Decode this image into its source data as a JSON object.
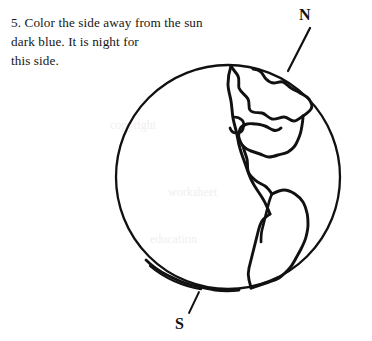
{
  "page": {
    "width": 372,
    "height": 341,
    "background_color": "#ffffff",
    "ink_color": "#111111"
  },
  "instruction": {
    "number": "5.",
    "text": "5. Color the side away from the sun\ndark blue. It is night for\nthis side."
  },
  "figure": {
    "name": "earth-globe-diagram",
    "circle": {
      "center_x": 228,
      "center_y": 177,
      "radius": 112,
      "stroke_color": "#111111",
      "stroke_width": 2.2,
      "fill": "none"
    },
    "labels": {
      "north": "N",
      "south": "S"
    },
    "pointer_lines": {
      "north": {
        "x1": 288,
        "y1": 71,
        "x2": 310,
        "y2": 28
      },
      "south": {
        "x1": 198,
        "y1": 290,
        "x2": 188,
        "y2": 313
      }
    }
  },
  "watermarks": [
    {
      "text": "copyright",
      "x": 110,
      "y": 124
    },
    {
      "text": "worksheet",
      "x": 168,
      "y": 190
    },
    {
      "text": "education",
      "x": 150,
      "y": 236
    }
  ]
}
